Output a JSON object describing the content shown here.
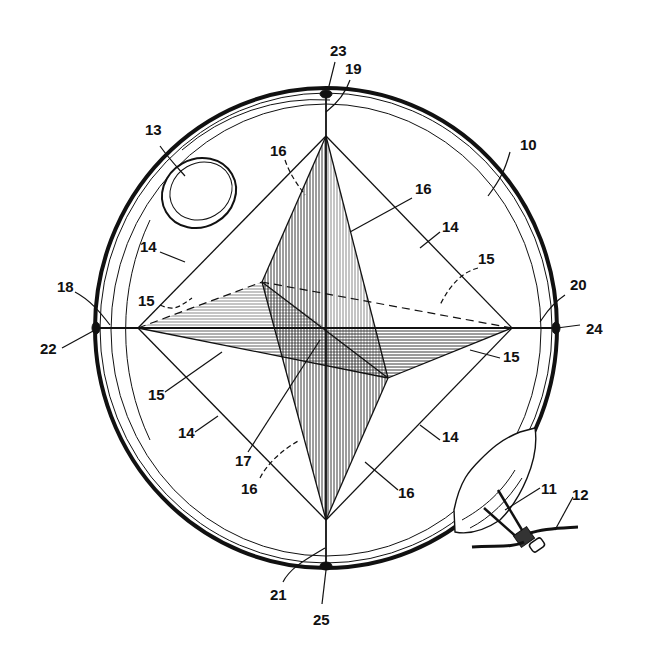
{
  "figure": {
    "type": "patent drawing",
    "labels": [
      {
        "id": "l10",
        "text": "10",
        "x": 520,
        "y": 150
      },
      {
        "id": "l11",
        "text": "11",
        "x": 545,
        "y": 494
      },
      {
        "id": "l12",
        "text": "12",
        "x": 576,
        "y": 500
      },
      {
        "id": "l13",
        "text": "13",
        "x": 145,
        "y": 135
      },
      {
        "id": "l14a",
        "text": "14",
        "x": 140,
        "y": 252
      },
      {
        "id": "l14b",
        "text": "14",
        "x": 448,
        "y": 230
      },
      {
        "id": "l14c",
        "text": "14",
        "x": 180,
        "y": 435
      },
      {
        "id": "l14d",
        "text": "14",
        "x": 448,
        "y": 438
      },
      {
        "id": "l15a",
        "text": "15",
        "x": 138,
        "y": 303
      },
      {
        "id": "l15b",
        "text": "15",
        "x": 480,
        "y": 262
      },
      {
        "id": "l15c",
        "text": "15",
        "x": 148,
        "y": 396
      },
      {
        "id": "l15d",
        "text": "15",
        "x": 505,
        "y": 362
      },
      {
        "id": "l16a",
        "text": "16",
        "x": 272,
        "y": 155
      },
      {
        "id": "l16b",
        "text": "16",
        "x": 420,
        "y": 192
      },
      {
        "id": "l16c",
        "text": "16",
        "x": 241,
        "y": 492
      },
      {
        "id": "l16d",
        "text": "16",
        "x": 400,
        "y": 495
      },
      {
        "id": "l17",
        "text": "17",
        "x": 237,
        "y": 462
      },
      {
        "id": "l18",
        "text": "18",
        "x": 57,
        "y": 290
      },
      {
        "id": "l19",
        "text": "19",
        "x": 345,
        "y": 73
      },
      {
        "id": "l20",
        "text": "20",
        "x": 572,
        "y": 288
      },
      {
        "id": "l21",
        "text": "21",
        "x": 272,
        "y": 597
      },
      {
        "id": "l22",
        "text": "22",
        "x": 40,
        "y": 352
      },
      {
        "id": "l23",
        "text": "23",
        "x": 330,
        "y": 54
      },
      {
        "id": "l24",
        "text": "24",
        "x": 588,
        "y": 330
      },
      {
        "id": "l25",
        "text": "25",
        "x": 323,
        "y": 620
      }
    ]
  }
}
